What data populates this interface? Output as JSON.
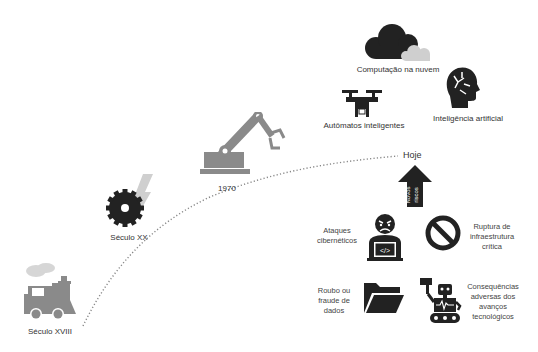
{
  "timeline": {
    "milestones": [
      {
        "id": "seculo-xviii",
        "label": "Século XVIII",
        "icon": "steam-train-icon"
      },
      {
        "id": "seculo-xx",
        "label": "Século XX",
        "icon": "saw-blade-electric-icon"
      },
      {
        "id": "1970",
        "label": "1970",
        "icon": "robotic-arm-icon"
      },
      {
        "id": "hoje",
        "label": "Hoje",
        "icon": null
      }
    ]
  },
  "technologies": [
    {
      "id": "cloud",
      "label": "Computação na nuvem",
      "icon": "cloud-icon"
    },
    {
      "id": "drone",
      "label": "Autômatos inteligentes",
      "icon": "drone-icon"
    },
    {
      "id": "ai",
      "label": "Inteligência artificial",
      "icon": "ai-head-icon"
    }
  ],
  "new_risks_arrow": {
    "label_line1": "Novos",
    "label_line2": "riscos"
  },
  "risks": [
    {
      "id": "cyberattacks",
      "label_lines": [
        "Ataques",
        "cibernéticos"
      ],
      "icon": "hacker-icon"
    },
    {
      "id": "infrastructure",
      "label_lines": [
        "Ruptura de",
        "infraestrutura",
        "crítica"
      ],
      "icon": "prohibited-icon"
    },
    {
      "id": "data-theft",
      "label_lines": [
        "Roubo ou",
        "fraude de",
        "dados"
      ],
      "icon": "folder-icon"
    },
    {
      "id": "tech-consequences",
      "label_lines": [
        "Consequências",
        "adversas dos",
        "avanços",
        "tecnológicos"
      ],
      "icon": "robot-icon"
    }
  ],
  "colors": {
    "dark_icon": "#222222",
    "gray_icon": "#8a8a8a",
    "light_gray": "#cfcfcf",
    "dots": "#888888"
  }
}
